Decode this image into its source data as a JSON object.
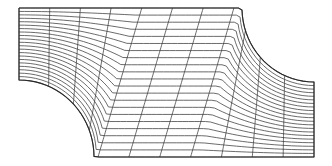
{
  "figure": {
    "type": "structured curvilinear mesh",
    "colors": {
      "background": "#ffffff",
      "line": "#3a3a3a",
      "boundary": "#2a2a2a"
    },
    "canvas": {
      "width": 332,
      "height": 166
    },
    "domain": {
      "top_left": [
        19,
        8
      ],
      "top_edge_end": [
        242,
        8
      ],
      "right_arc_end": [
        314,
        82
      ],
      "bottom_right": [
        314,
        157
      ],
      "bottom_left_start": [
        94,
        157
      ],
      "left_edge_end": [
        19,
        80
      ]
    },
    "mesh": {
      "xi_lines": 12,
      "eta_lines": 22
    }
  }
}
